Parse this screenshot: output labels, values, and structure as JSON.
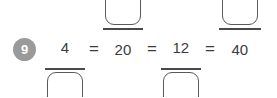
{
  "problem": {
    "number": "9",
    "badge_color": "#9a9a9a",
    "ink_color": "#3c3c3c",
    "box_border_color": "#5a5a5a",
    "background": "#ffffff"
  },
  "equation": {
    "operator_1": "=",
    "operator_2": "=",
    "operator_3": "=",
    "fractions": [
      {
        "id": "fraction-1",
        "numerator": "4",
        "numerator_is_blank": false,
        "denominator": "",
        "denominator_is_blank": true
      },
      {
        "id": "fraction-2",
        "numerator": "",
        "numerator_is_blank": true,
        "denominator": "20",
        "denominator_is_blank": false
      },
      {
        "id": "fraction-3",
        "numerator": "12",
        "numerator_is_blank": false,
        "denominator": "",
        "denominator_is_blank": true
      },
      {
        "id": "fraction-4",
        "numerator": "",
        "numerator_is_blank": true,
        "denominator": "40",
        "denominator_is_blank": false
      }
    ]
  }
}
